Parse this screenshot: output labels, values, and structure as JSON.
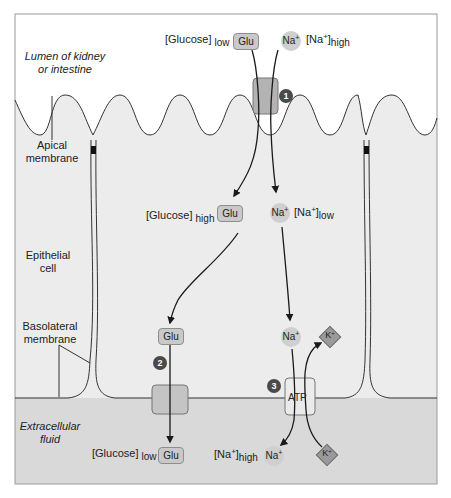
{
  "regions": {
    "lumen": "Lumen of kidney or intestine",
    "lumen_line1": "Lumen of kidney",
    "lumen_line2": "or intestine",
    "apical_line1": "Apical",
    "apical_line2": "membrane",
    "epithelial_line1": "Epithelial",
    "epithelial_line2": "cell",
    "basolateral_line1": "Basolateral",
    "basolateral_line2": "membrane",
    "extracellular_line1": "Extracellular",
    "extracellular_line2": "fluid"
  },
  "lumen_side": {
    "glucose_label": "[Glucose]",
    "glucose_sub": "low",
    "glu": "Glu",
    "na": "Na",
    "na_sup": "+",
    "na_conc_prefix": "[Na",
    "na_conc_sup": "+",
    "na_conc_suffix": "]",
    "na_conc_sub": "high"
  },
  "cell_side": {
    "glucose_label": "[Glucose]",
    "glucose_sub": "high",
    "glu": "Glu",
    "na": "Na",
    "na_sup": "+",
    "na_conc_prefix": "[Na",
    "na_conc_sup": "+",
    "na_conc_suffix": "]",
    "na_conc_sub": "low",
    "glu_lower": "Glu",
    "na_lower": "Na",
    "na_lower_sup": "+",
    "k": "K",
    "k_sup": "+"
  },
  "ecf_side": {
    "glucose_label": "[Glucose]",
    "glucose_sub": "low",
    "glu": "Glu",
    "na_conc_prefix": "[Na",
    "na_conc_sup": "+",
    "na_conc_suffix": "]",
    "na_conc_sub": "high",
    "na": "Na",
    "na_sup": "+",
    "k": "K",
    "k_sup": "+"
  },
  "transporters": {
    "step1": "1",
    "step2": "2",
    "step3": "3",
    "pump_label": "ATP"
  },
  "colors": {
    "cell_fill": "#ececec",
    "ecf_fill": "#d9d9d9",
    "lumen_fill": "#ffffff",
    "transporter_fill": "#b3b3b3",
    "step_badge": "#4a4a4a",
    "ion_fill": "#cfcfcf",
    "k_fill": "#9a9a9a"
  }
}
